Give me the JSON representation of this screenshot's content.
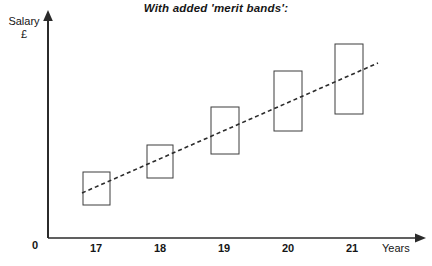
{
  "chart": {
    "title": "With added 'merit bands':",
    "y_axis": {
      "label": "Salary",
      "unit": "£"
    },
    "x_axis": {
      "label": "Years"
    },
    "origin_label": "0"
  },
  "chart_data": {
    "type": "bar",
    "title": "With added 'merit bands':",
    "subtitle": "",
    "xlabel": "Years",
    "ylabel": "Salary £",
    "categories": [
      "17",
      "18",
      "19",
      "20",
      "21"
    ],
    "tick_labels": [
      "17",
      "18",
      "19",
      "20",
      "21"
    ],
    "grid": false,
    "legend": false,
    "xlim": [
      16.5,
      21.9
    ],
    "ylim": [
      0,
      100
    ],
    "axis_arrows": true,
    "series": [
      {
        "name": "Merit bands",
        "type": "range-box",
        "style": {
          "fill": "none",
          "stroke": "#3c3c3c",
          "stroke_width": 1
        },
        "boxes": [
          {
            "category": "17",
            "low": 15,
            "high": 29,
            "x": 83,
            "y": 172,
            "w": 27,
            "h": 33
          },
          {
            "category": "18",
            "low": 26,
            "high": 40,
            "x": 147,
            "y": 145,
            "w": 26,
            "h": 33
          },
          {
            "category": "19",
            "low": 37,
            "high": 58,
            "x": 211,
            "y": 107,
            "w": 28,
            "h": 47
          },
          {
            "category": "20",
            "low": 47,
            "high": 74,
            "x": 274,
            "y": 71,
            "w": 28,
            "h": 60
          },
          {
            "category": "21",
            "low": 55,
            "high": 86,
            "x": 335,
            "y": 44,
            "w": 28,
            "h": 70
          }
        ]
      },
      {
        "name": "Trend line",
        "type": "line",
        "style": {
          "stroke": "#2b2b2b",
          "stroke_width": 1.6,
          "dash": "4 3"
        },
        "points": [
          {
            "x": 82,
            "y": 193,
            "value": 20
          },
          {
            "x": 378,
            "y": 63,
            "value": 78
          }
        ]
      }
    ]
  },
  "geometry": {
    "axes": {
      "y_axis": {
        "x": 48,
        "y_top": 12,
        "y_bottom": 238
      },
      "x_axis": {
        "y": 238,
        "x_left": 48,
        "x_right": 425
      }
    },
    "tick_positions": [
      96,
      160,
      224,
      288,
      352
    ]
  },
  "colors": {
    "background": "#ffffff",
    "axis": "#2b2b2b",
    "box_stroke": "#3c3c3c",
    "trend": "#2b2b2b",
    "text": "#161616"
  }
}
